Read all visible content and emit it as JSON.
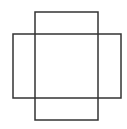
{
  "diagram": {
    "background": "#ffffff",
    "stroke_color": "#333333",
    "stroke_width": 1.5,
    "shapes": [
      {
        "name": "vertical-rectangle",
        "x": 35,
        "y": 12,
        "width": 63,
        "height": 108
      },
      {
        "name": "horizontal-rectangle",
        "x": 13,
        "y": 34,
        "width": 108,
        "height": 64
      }
    ]
  }
}
